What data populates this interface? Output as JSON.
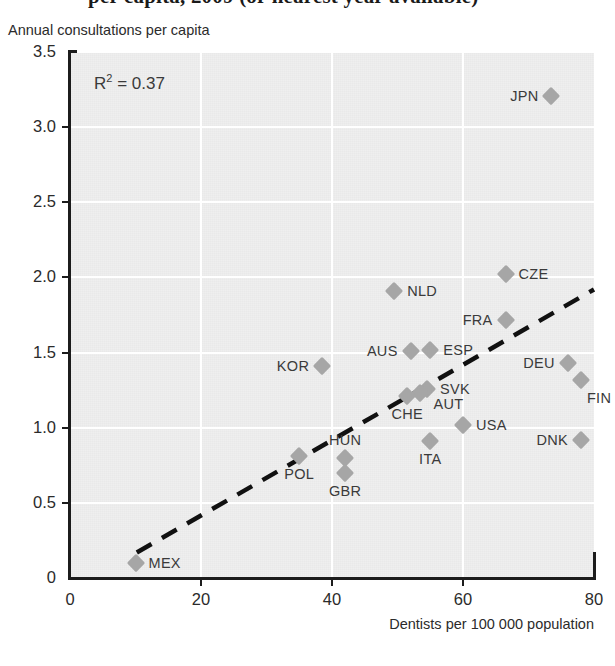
{
  "figure": {
    "title_clipped": "per capita, 2009 (or nearest year available)",
    "r2_label": "R",
    "r2_sup": "2",
    "r2_value": "= 0.37"
  },
  "axes": {
    "y_caption": "Annual consultations per capita",
    "x_caption": "Dentists per 100 000 population",
    "y_ticks": [
      "0",
      "0.5",
      "1.0",
      "1.5",
      "2.0",
      "2.5",
      "3.0",
      "3.5"
    ],
    "x_ticks": [
      "0",
      "20",
      "40",
      "60",
      "80"
    ]
  },
  "colors": {
    "marker": "#a6a6a6",
    "plot_background": "#efefef",
    "gridline": "#ffffff",
    "axis": "#1c1c1c",
    "text": "#3a3a3a",
    "trend": "#111111"
  },
  "chart_data": {
    "type": "scatter",
    "xlabel": "Dentists per 100 000 population",
    "ylabel": "Annual consultations per capita",
    "xlim": [
      0,
      80
    ],
    "ylim": [
      0,
      3.5
    ],
    "xticks": [
      0,
      20,
      40,
      60,
      80
    ],
    "yticks": [
      0,
      0.5,
      1.0,
      1.5,
      2.0,
      2.5,
      3.0,
      3.5
    ],
    "grid": true,
    "legend": false,
    "r_squared": 0.37,
    "annotations": [
      "R² = 0.37"
    ],
    "trendline": {
      "style": "dashed",
      "x": [
        10.2,
        80.0
      ],
      "y": [
        0.17,
        1.92
      ]
    },
    "points": [
      {
        "label": "JPN",
        "x": 73.5,
        "y": 3.21,
        "label_pos": "left"
      },
      {
        "label": "CZE",
        "x": 66.5,
        "y": 2.02,
        "label_pos": "right"
      },
      {
        "label": "NLD",
        "x": 49.5,
        "y": 1.91,
        "label_pos": "right"
      },
      {
        "label": "FRA",
        "x": 66.5,
        "y": 1.72,
        "label_pos": "left"
      },
      {
        "label": "AUS",
        "x": 52.0,
        "y": 1.51,
        "label_pos": "left"
      },
      {
        "label": "ESP",
        "x": 55.0,
        "y": 1.52,
        "label_pos": "right"
      },
      {
        "label": "KOR",
        "x": 38.5,
        "y": 1.41,
        "label_pos": "left"
      },
      {
        "label": "DEU",
        "x": 76.0,
        "y": 1.43,
        "label_pos": "left"
      },
      {
        "label": "FIN",
        "x": 78.0,
        "y": 1.32,
        "label_pos": "below-right"
      },
      {
        "label": "SVK",
        "x": 54.5,
        "y": 1.26,
        "label_pos": "right"
      },
      {
        "label": "AUT",
        "x": 53.5,
        "y": 1.23,
        "label_pos": "right-lower"
      },
      {
        "label": "CHE",
        "x": 51.5,
        "y": 1.21,
        "label_pos": "below"
      },
      {
        "label": "USA",
        "x": 60.0,
        "y": 1.02,
        "label_pos": "right"
      },
      {
        "label": "DNK",
        "x": 78.0,
        "y": 0.92,
        "label_pos": "left"
      },
      {
        "label": "ITA",
        "x": 55.0,
        "y": 0.91,
        "label_pos": "below"
      },
      {
        "label": "HUN",
        "x": 42.0,
        "y": 0.8,
        "label_pos": "above"
      },
      {
        "label": "POL",
        "x": 35.0,
        "y": 0.81,
        "label_pos": "below"
      },
      {
        "label": "GBR",
        "x": 42.0,
        "y": 0.7,
        "label_pos": "below"
      },
      {
        "label": "MEX",
        "x": 10.0,
        "y": 0.1,
        "label_pos": "right"
      }
    ]
  }
}
